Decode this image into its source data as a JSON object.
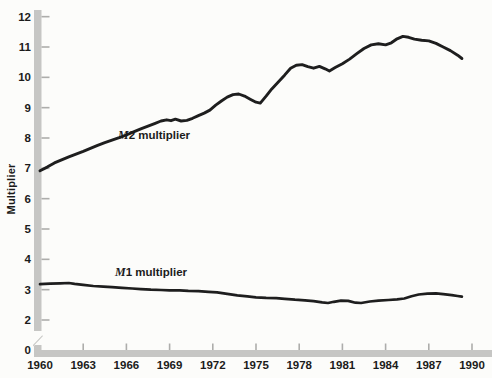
{
  "figure": {
    "ylabel": "Multiplier",
    "series_labels": {
      "m2": {
        "prefix": "M",
        "rest": "2 multiplier"
      },
      "m1": {
        "prefix": "M",
        "rest": "1 multiplier"
      }
    }
  },
  "colors": {
    "background": "#fcfcfa",
    "axis_bar": "#c6c6c4",
    "tick": "#adadab",
    "text": "#1b1b1b",
    "curve": "#1e1e1e"
  },
  "chart_data": {
    "type": "line",
    "title": "",
    "xlabel": "",
    "ylabel": "Multiplier",
    "x_ticks": [
      1960,
      1963,
      1966,
      1969,
      1972,
      1975,
      1978,
      1981,
      1984,
      1987,
      1990
    ],
    "y_ticks": [
      12,
      11,
      10,
      9,
      8,
      7,
      6,
      5,
      4,
      3,
      2,
      0
    ],
    "y_axis_break_between": [
      0,
      2
    ],
    "xlim": [
      1960,
      1991.4
    ],
    "ylim": [
      0,
      12.3
    ],
    "grid": false,
    "legend_position": "inline-annotations",
    "series": [
      {
        "name": "M2 multiplier",
        "points": [
          [
            1960,
            6.92
          ],
          [
            1960.5,
            7.04
          ],
          [
            1961,
            7.18
          ],
          [
            1961.5,
            7.28
          ],
          [
            1962,
            7.38
          ],
          [
            1962.5,
            7.47
          ],
          [
            1963,
            7.56
          ],
          [
            1963.5,
            7.66
          ],
          [
            1964,
            7.76
          ],
          [
            1964.5,
            7.85
          ],
          [
            1965,
            7.93
          ],
          [
            1965.5,
            8.01
          ],
          [
            1966,
            8.1
          ],
          [
            1966.5,
            8.2
          ],
          [
            1967,
            8.3
          ],
          [
            1967.5,
            8.39
          ],
          [
            1968,
            8.48
          ],
          [
            1968.4,
            8.56
          ],
          [
            1968.8,
            8.6
          ],
          [
            1969.1,
            8.57
          ],
          [
            1969.4,
            8.62
          ],
          [
            1969.8,
            8.56
          ],
          [
            1970.2,
            8.58
          ],
          [
            1970.6,
            8.65
          ],
          [
            1971,
            8.74
          ],
          [
            1971.4,
            8.82
          ],
          [
            1971.8,
            8.92
          ],
          [
            1972.2,
            9.08
          ],
          [
            1972.6,
            9.22
          ],
          [
            1973,
            9.35
          ],
          [
            1973.4,
            9.43
          ],
          [
            1973.8,
            9.45
          ],
          [
            1974.2,
            9.38
          ],
          [
            1974.6,
            9.28
          ],
          [
            1975,
            9.18
          ],
          [
            1975.3,
            9.15
          ],
          [
            1975.7,
            9.38
          ],
          [
            1976.1,
            9.62
          ],
          [
            1976.5,
            9.82
          ],
          [
            1977,
            10.08
          ],
          [
            1977.4,
            10.3
          ],
          [
            1977.8,
            10.4
          ],
          [
            1978.2,
            10.42
          ],
          [
            1978.6,
            10.35
          ],
          [
            1979,
            10.3
          ],
          [
            1979.4,
            10.36
          ],
          [
            1979.8,
            10.28
          ],
          [
            1980.1,
            10.21
          ],
          [
            1980.5,
            10.32
          ],
          [
            1981,
            10.45
          ],
          [
            1981.5,
            10.6
          ],
          [
            1982,
            10.78
          ],
          [
            1982.5,
            10.95
          ],
          [
            1983,
            11.07
          ],
          [
            1983.5,
            11.11
          ],
          [
            1984,
            11.07
          ],
          [
            1984.4,
            11.14
          ],
          [
            1984.8,
            11.27
          ],
          [
            1985.2,
            11.35
          ],
          [
            1985.6,
            11.32
          ],
          [
            1986,
            11.26
          ],
          [
            1986.5,
            11.22
          ],
          [
            1987,
            11.2
          ],
          [
            1987.5,
            11.12
          ],
          [
            1988,
            11.0
          ],
          [
            1988.5,
            10.88
          ],
          [
            1989,
            10.73
          ],
          [
            1989.3,
            10.62
          ]
        ]
      },
      {
        "name": "M1 multiplier",
        "points": [
          [
            1960,
            3.18
          ],
          [
            1960.7,
            3.2
          ],
          [
            1961.4,
            3.21
          ],
          [
            1962,
            3.22
          ],
          [
            1962.4,
            3.19
          ],
          [
            1963,
            3.16
          ],
          [
            1963.7,
            3.12
          ],
          [
            1964.4,
            3.1
          ],
          [
            1965,
            3.08
          ],
          [
            1965.7,
            3.06
          ],
          [
            1966.4,
            3.04
          ],
          [
            1967,
            3.02
          ],
          [
            1967.7,
            3.0
          ],
          [
            1968.4,
            2.99
          ],
          [
            1969,
            2.98
          ],
          [
            1969.7,
            2.98
          ],
          [
            1970.3,
            2.96
          ],
          [
            1971,
            2.95
          ],
          [
            1971.7,
            2.93
          ],
          [
            1972.3,
            2.91
          ],
          [
            1973,
            2.86
          ],
          [
            1973.7,
            2.81
          ],
          [
            1974.4,
            2.78
          ],
          [
            1975,
            2.75
          ],
          [
            1975.7,
            2.73
          ],
          [
            1976.4,
            2.72
          ],
          [
            1977,
            2.7
          ],
          [
            1977.7,
            2.67
          ],
          [
            1978.4,
            2.65
          ],
          [
            1979,
            2.62
          ],
          [
            1979.6,
            2.58
          ],
          [
            1980,
            2.56
          ],
          [
            1980.4,
            2.6
          ],
          [
            1980.9,
            2.64
          ],
          [
            1981.4,
            2.63
          ],
          [
            1981.9,
            2.57
          ],
          [
            1982.3,
            2.56
          ],
          [
            1982.9,
            2.61
          ],
          [
            1983.5,
            2.64
          ],
          [
            1984.2,
            2.66
          ],
          [
            1984.8,
            2.68
          ],
          [
            1985.3,
            2.71
          ],
          [
            1985.8,
            2.78
          ],
          [
            1986.3,
            2.84
          ],
          [
            1986.9,
            2.87
          ],
          [
            1987.5,
            2.88
          ],
          [
            1988,
            2.85
          ],
          [
            1988.6,
            2.82
          ],
          [
            1989,
            2.79
          ],
          [
            1989.3,
            2.77
          ]
        ]
      }
    ]
  }
}
